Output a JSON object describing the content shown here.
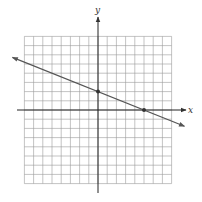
{
  "chart_data": {
    "type": "line",
    "title": "",
    "xlabel": "x",
    "ylabel": "y",
    "grid": true,
    "xlim": [
      -8,
      8
    ],
    "ylim": [
      -8,
      8
    ],
    "tick_labels": false,
    "series": [
      {
        "name": "line",
        "equation": "y = -2/5 x + 2",
        "slope": -0.4,
        "intercept": 2,
        "arrows_both_ends": true,
        "color": "#555555"
      }
    ],
    "points": [
      {
        "label": "y-intercept",
        "x": 0,
        "y": 2
      },
      {
        "label": "x-intercept",
        "x": 5,
        "y": 0
      }
    ]
  },
  "colors": {
    "grid": "#9a9a9a",
    "axis": "#222222",
    "line": "#555555",
    "point": "#333333"
  }
}
